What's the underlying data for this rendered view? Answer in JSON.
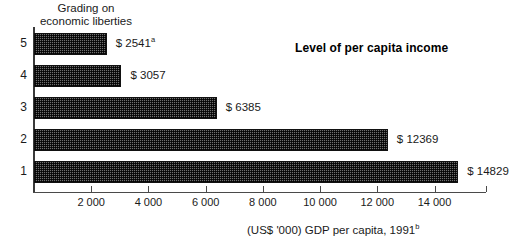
{
  "chart_data": {
    "type": "bar",
    "orientation": "horizontal",
    "title": "Level of per capita income",
    "ylabel": "Grading on\neconomic liberties",
    "xlabel": "(US$ '000) GDP per capita, 1991",
    "xlabel_footnote": "b",
    "categories": [
      "5",
      "4",
      "3",
      "2",
      "1"
    ],
    "values": [
      2541,
      3057,
      6385,
      12369,
      14829
    ],
    "value_labels": [
      "$ 2541",
      "$ 3057",
      "$ 6385",
      "$ 12369",
      "$ 14829"
    ],
    "value_label_footnotes": [
      "a",
      "",
      "",
      "",
      ""
    ],
    "xlim": [
      0,
      15800
    ],
    "xticks": [
      2000,
      4000,
      6000,
      8000,
      10000,
      12000,
      14000
    ],
    "xtick_labels": [
      "2 000",
      "4 000",
      "6 000",
      "8 000",
      "10 000",
      "12 000",
      "14 000"
    ],
    "grid": false,
    "legend": false,
    "bar_fill_color": "#6e6e6e",
    "bar_edge_color": "#111111",
    "axis_color": "#4a4a4a",
    "background_color": "#ffffff"
  },
  "axes": {
    "y_caption": "Grading on\neconomic liberties",
    "x_caption": "(US$ '000) GDP per capita, 1991",
    "x_caption_footnote": "b"
  },
  "annotation": {
    "series_title": "Level of per capita income"
  },
  "ticks": {
    "x": [
      {
        "label": "2 000",
        "value": 2000
      },
      {
        "label": "4 000",
        "value": 4000
      },
      {
        "label": "6 000",
        "value": 6000
      },
      {
        "label": "8 000",
        "value": 8000
      },
      {
        "label": "10 000",
        "value": 10000
      },
      {
        "label": "12 000",
        "value": 12000
      },
      {
        "label": "14 000",
        "value": 14000
      }
    ],
    "y": [
      {
        "label": "5"
      },
      {
        "label": "4"
      },
      {
        "label": "3"
      },
      {
        "label": "2"
      },
      {
        "label": "1"
      }
    ]
  },
  "bars": [
    {
      "category": "5",
      "value": 2541,
      "label": "$ 2541",
      "footnote": "a"
    },
    {
      "category": "4",
      "value": 3057,
      "label": "$ 3057",
      "footnote": ""
    },
    {
      "category": "3",
      "value": 6385,
      "label": "$ 6385",
      "footnote": ""
    },
    {
      "category": "2",
      "value": 12369,
      "label": "$ 12369",
      "footnote": ""
    },
    {
      "category": "1",
      "value": 14829,
      "label": "$ 14829",
      "footnote": ""
    }
  ]
}
